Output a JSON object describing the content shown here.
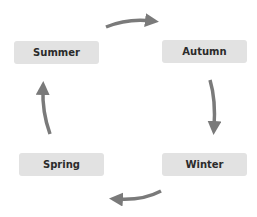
{
  "diagram": {
    "type": "cycle",
    "nodes": [
      {
        "id": "summer",
        "label": "Summer"
      },
      {
        "id": "autumn",
        "label": "Autumn"
      },
      {
        "id": "winter",
        "label": "Winter"
      },
      {
        "id": "spring",
        "label": "Spring"
      }
    ],
    "edges": [
      {
        "from": "summer",
        "to": "autumn"
      },
      {
        "from": "autumn",
        "to": "winter"
      },
      {
        "from": "winter",
        "to": "spring"
      },
      {
        "from": "spring",
        "to": "summer"
      }
    ],
    "colors": {
      "node_fill": "#e2e2e2",
      "node_text": "#2b2b2b",
      "arrow": "#7a7a7a"
    }
  }
}
